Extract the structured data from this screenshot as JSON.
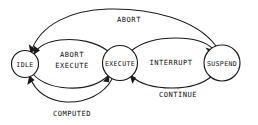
{
  "diagram": {
    "type": "state-transition-diagram",
    "title": "",
    "background_color": "#ffffff",
    "line_color": "#1a1a1a",
    "text_color": "#111111",
    "states": [
      {
        "id": "idle",
        "label": "IDLE",
        "cx": 25,
        "cy": 64,
        "r": 13.5
      },
      {
        "id": "execute",
        "label": "EXECUTE",
        "cx": 120,
        "cy": 63,
        "r": 17.5
      },
      {
        "id": "suspend",
        "label": "SUSPEND",
        "cx": 222,
        "cy": 63,
        "r": 18.0
      }
    ],
    "transitions": [
      {
        "id": "abort",
        "label": "ABORT",
        "from": "suspend",
        "to": "idle",
        "label_x": 129,
        "label_y": 19
      },
      {
        "id": "abort-execute",
        "label_line1": "ABORT",
        "label_line2": "EXECUTE",
        "from": "execute",
        "to": "idle",
        "label_x": 72,
        "label_y": 58
      },
      {
        "id": "computed",
        "label": "COMPUTED",
        "from": "execute",
        "to": "idle",
        "label_x": 72,
        "label_y": 113
      },
      {
        "id": "interrupt",
        "label": "INTERRUPT",
        "from": "execute",
        "to": "suspend",
        "label_x": 171,
        "label_y": 62
      },
      {
        "id": "continue",
        "label": "CONTINUE",
        "from": "suspend",
        "to": "execute",
        "label_x": 178,
        "label_y": 94
      }
    ]
  }
}
